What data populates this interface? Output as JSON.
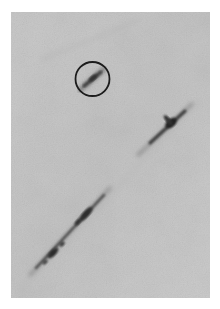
{
  "image": {
    "description": "Grayscale photograph showing diagonal dark streaks (tracks) on a mottled light-gray background, with one short streak highlighted by a black circle",
    "background_color": "#c6c6c6",
    "frame_color": "#ffffff",
    "streak_color": "#2e2e2e"
  },
  "annotations": {
    "circle": {
      "label": "highlighted-track",
      "color": "#1c1c1c",
      "center": [
        92,
        79
      ],
      "radius": 17
    }
  },
  "tracks": [
    {
      "name": "circled-short-track",
      "from": [
        82,
        89
      ],
      "to": [
        103,
        70
      ]
    },
    {
      "name": "upper-right-track",
      "from": [
        145,
        148
      ],
      "to": [
        188,
        108
      ]
    },
    {
      "name": "lower-left-long-track",
      "from": [
        35,
        270
      ],
      "to": [
        105,
        192
      ]
    }
  ]
}
